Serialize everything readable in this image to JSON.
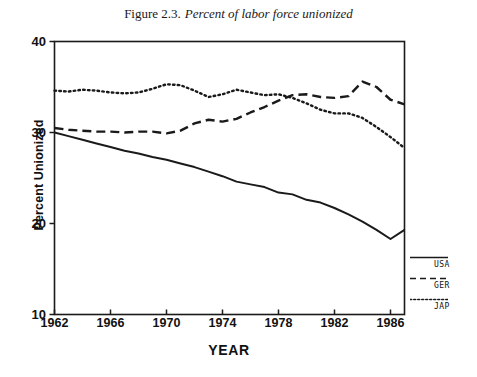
{
  "title": {
    "number": "Figure 2.3.",
    "caption": "Percent of labor force unionized"
  },
  "axes": {
    "y_title": "Percent Unionized",
    "x_title": "YEAR",
    "y_ticks": [
      "40",
      "30",
      "20",
      "10"
    ],
    "x_ticks": [
      "1962",
      "1966",
      "1970",
      "1974",
      "1978",
      "1982",
      "1986"
    ]
  },
  "legend": {
    "items": [
      {
        "label": "USA",
        "style": "solid"
      },
      {
        "label": "GER",
        "style": "dashed"
      },
      {
        "label": "JAP",
        "style": "dotted"
      }
    ]
  },
  "chart_data": {
    "type": "line",
    "xlabel": "YEAR",
    "ylabel": "Percent Unionized",
    "xlim": [
      1962,
      1987
    ],
    "ylim": [
      10,
      40
    ],
    "xticks": [
      1962,
      1966,
      1970,
      1974,
      1978,
      1982,
      1986
    ],
    "yticks": [
      10,
      20,
      30,
      40
    ],
    "grid": false,
    "legend_position": "right-outside",
    "x": [
      1962,
      1963,
      1964,
      1965,
      1966,
      1967,
      1968,
      1969,
      1970,
      1971,
      1972,
      1973,
      1974,
      1975,
      1976,
      1977,
      1978,
      1979,
      1980,
      1981,
      1982,
      1983,
      1984,
      1985,
      1986,
      1987
    ],
    "series": [
      {
        "name": "USA",
        "style": "solid",
        "values": [
          30.0,
          29.6,
          29.2,
          28.8,
          28.4,
          28.0,
          27.7,
          27.3,
          27.0,
          26.6,
          26.2,
          25.7,
          25.2,
          24.6,
          24.3,
          24.0,
          23.4,
          23.2,
          22.6,
          22.3,
          21.7,
          21.0,
          20.2,
          19.3,
          18.3,
          19.3
        ]
      },
      {
        "name": "GER",
        "style": "dashed",
        "values": [
          30.5,
          30.3,
          30.2,
          30.1,
          30.1,
          30.0,
          30.1,
          30.1,
          29.9,
          30.2,
          31.0,
          31.4,
          31.2,
          31.5,
          32.2,
          32.8,
          33.5,
          34.1,
          34.2,
          33.9,
          33.8,
          34.0,
          35.6,
          35.0,
          33.6,
          33.1
        ]
      },
      {
        "name": "JAP",
        "style": "dotted",
        "values": [
          34.6,
          34.5,
          34.7,
          34.6,
          34.4,
          34.3,
          34.4,
          34.8,
          35.3,
          35.2,
          34.6,
          33.9,
          34.2,
          34.7,
          34.4,
          34.1,
          34.2,
          33.8,
          33.2,
          32.5,
          32.1,
          32.1,
          31.6,
          30.6,
          29.5,
          28.3
        ]
      }
    ]
  }
}
